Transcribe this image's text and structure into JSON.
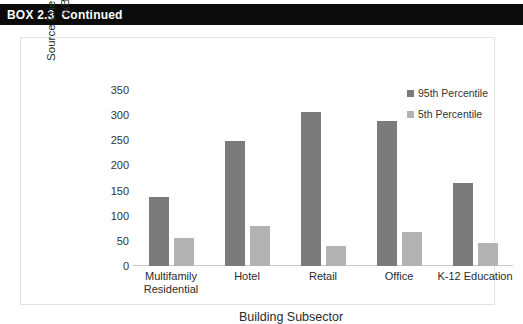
{
  "header": {
    "label": "BOX 2.3  Continued"
  },
  "chart_data": {
    "type": "bar",
    "title": "",
    "xlabel": "Building Subsector",
    "ylabel": "Source Energy Use Intensity (kBtu/sq ft)",
    "ylabel_line1": "Source Energy Use Intensity",
    "ylabel_line2": "(kBtu/sq ft)",
    "categories": [
      "Multifamily Residential",
      "Hotel",
      "Retail",
      "Office",
      "K-12 Education"
    ],
    "category_lines": [
      [
        "Multifamily",
        "Residential"
      ],
      [
        "Hotel"
      ],
      [
        "Retail"
      ],
      [
        "Office"
      ],
      [
        "K-12 Education"
      ]
    ],
    "series": [
      {
        "name": "95th Percentile",
        "color": "#7b7b7b",
        "values": [
          138,
          249,
          306,
          288,
          166
        ]
      },
      {
        "name": "5th Percentile",
        "color": "#b3b3b3",
        "values": [
          56,
          79,
          40,
          68,
          45
        ]
      }
    ],
    "ylim": [
      0,
      350
    ],
    "yticks": [
      0,
      50,
      100,
      150,
      200,
      250,
      300,
      350
    ],
    "ytick_labels": [
      "0",
      "50",
      "100",
      "150",
      "200",
      "250",
      "300",
      "350"
    ],
    "grid": false,
    "legend_position": "top-right"
  }
}
